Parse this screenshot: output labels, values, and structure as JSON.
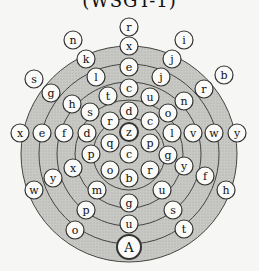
{
  "title": "(WSGT-1)",
  "colors": {
    "background": "#f6f6f4",
    "ring_fill": "#c4c4c0",
    "ring_line": "#444444",
    "node_fill": "#fafaf8",
    "node_stroke": "#333333"
  },
  "maze": {
    "center": [
      129,
      154
    ],
    "rings": [
      108,
      90,
      72,
      54,
      36
    ],
    "start_label": "A",
    "center_label": "z",
    "nodes": [
      {
        "id": "n01",
        "label": "r",
        "x": 129,
        "y": 27
      },
      {
        "id": "n02",
        "label": "x",
        "x": 129,
        "y": 46
      },
      {
        "id": "n03",
        "label": "e",
        "x": 129,
        "y": 67
      },
      {
        "id": "n04",
        "label": "c",
        "x": 129,
        "y": 88
      },
      {
        "id": "n05",
        "label": "d",
        "x": 129,
        "y": 111
      },
      {
        "id": "n06",
        "label": "z",
        "x": 129,
        "y": 132
      },
      {
        "id": "n07",
        "label": "c",
        "x": 129,
        "y": 154
      },
      {
        "id": "n08",
        "label": "b",
        "x": 129,
        "y": 178
      },
      {
        "id": "n09",
        "label": "g",
        "x": 129,
        "y": 203
      },
      {
        "id": "n10",
        "label": "u",
        "x": 129,
        "y": 224
      },
      {
        "id": "n11",
        "label": "A",
        "x": 129,
        "y": 247
      },
      {
        "id": "n12",
        "label": "n",
        "x": 73,
        "y": 40
      },
      {
        "id": "n13",
        "label": "k",
        "x": 86,
        "y": 59
      },
      {
        "id": "n14",
        "label": "l",
        "x": 96,
        "y": 77
      },
      {
        "id": "n15",
        "label": "t",
        "x": 108,
        "y": 96
      },
      {
        "id": "n16",
        "label": "s",
        "x": 34,
        "y": 79
      },
      {
        "id": "n17",
        "label": "g",
        "x": 51,
        "y": 93
      },
      {
        "id": "n18",
        "label": "h",
        "x": 72,
        "y": 104
      },
      {
        "id": "n19",
        "label": "s",
        "x": 90,
        "y": 112
      },
      {
        "id": "n20",
        "label": "r",
        "x": 110,
        "y": 121
      },
      {
        "id": "n21",
        "label": "x",
        "x": 20,
        "y": 133
      },
      {
        "id": "n22",
        "label": "e",
        "x": 42,
        "y": 133
      },
      {
        "id": "n23",
        "label": "f",
        "x": 64,
        "y": 133
      },
      {
        "id": "n24",
        "label": "d",
        "x": 87,
        "y": 133
      },
      {
        "id": "n25",
        "label": "q",
        "x": 110,
        "y": 143
      },
      {
        "id": "n26",
        "label": "p",
        "x": 91,
        "y": 154
      },
      {
        "id": "n27",
        "label": "x",
        "x": 73,
        "y": 168
      },
      {
        "id": "n28",
        "label": "y",
        "x": 53,
        "y": 178
      },
      {
        "id": "n29",
        "label": "w",
        "x": 34,
        "y": 190
      },
      {
        "id": "n30",
        "label": "o",
        "x": 110,
        "y": 170
      },
      {
        "id": "n31",
        "label": "m",
        "x": 97,
        "y": 190
      },
      {
        "id": "n32",
        "label": "p",
        "x": 86,
        "y": 210
      },
      {
        "id": "n33",
        "label": "o",
        "x": 75,
        "y": 230
      },
      {
        "id": "n34",
        "label": "i",
        "x": 184,
        "y": 40
      },
      {
        "id": "n35",
        "label": "j",
        "x": 172,
        "y": 59
      },
      {
        "id": "n36",
        "label": "j",
        "x": 161,
        "y": 77
      },
      {
        "id": "n37",
        "label": "u",
        "x": 150,
        "y": 97
      },
      {
        "id": "n38",
        "label": "b",
        "x": 224,
        "y": 75
      },
      {
        "id": "n39",
        "label": "r",
        "x": 204,
        "y": 89
      },
      {
        "id": "n40",
        "label": "n",
        "x": 184,
        "y": 101
      },
      {
        "id": "n41",
        "label": "o",
        "x": 168,
        "y": 113
      },
      {
        "id": "n42",
        "label": "c",
        "x": 150,
        "y": 121
      },
      {
        "id": "n43",
        "label": "l",
        "x": 172,
        "y": 133
      },
      {
        "id": "n44",
        "label": "v",
        "x": 193,
        "y": 133
      },
      {
        "id": "n45",
        "label": "w",
        "x": 214,
        "y": 133
      },
      {
        "id": "n46",
        "label": "y",
        "x": 237,
        "y": 133
      },
      {
        "id": "n47",
        "label": "p",
        "x": 150,
        "y": 143
      },
      {
        "id": "n48",
        "label": "g",
        "x": 168,
        "y": 155
      },
      {
        "id": "n49",
        "label": "y",
        "x": 184,
        "y": 166
      },
      {
        "id": "n50",
        "label": "f",
        "x": 205,
        "y": 176
      },
      {
        "id": "n51",
        "label": "h",
        "x": 226,
        "y": 190
      },
      {
        "id": "n52",
        "label": "r",
        "x": 150,
        "y": 170
      },
      {
        "id": "n53",
        "label": "u",
        "x": 162,
        "y": 190
      },
      {
        "id": "n54",
        "label": "s",
        "x": 173,
        "y": 210
      },
      {
        "id": "n55",
        "label": "t",
        "x": 184,
        "y": 229
      }
    ]
  }
}
